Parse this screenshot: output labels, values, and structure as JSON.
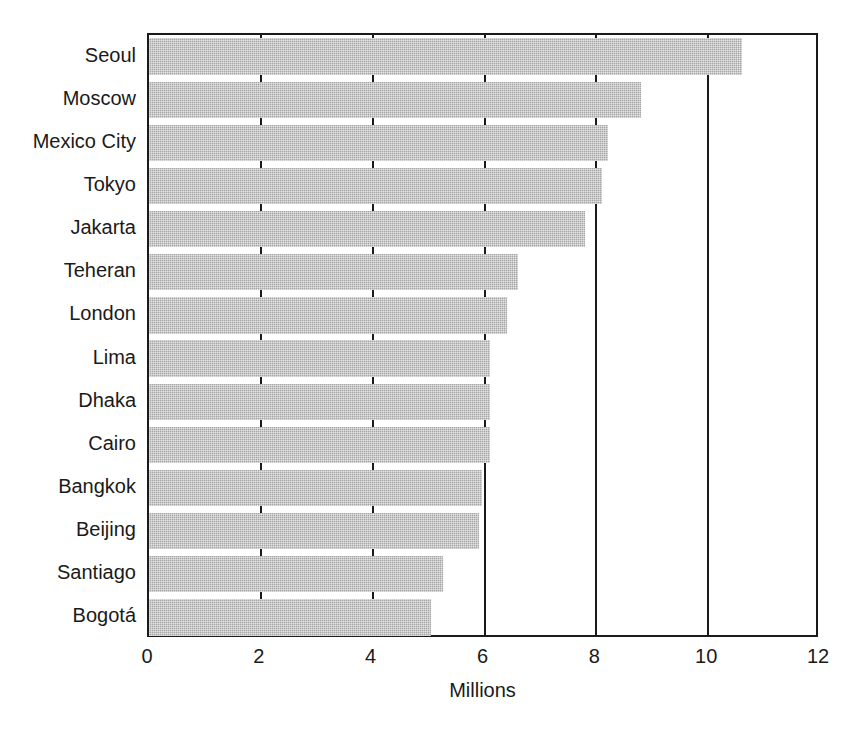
{
  "chart_data": {
    "type": "bar",
    "orientation": "horizontal",
    "title": "",
    "xlabel": "Millions",
    "ylabel": "",
    "xlim": [
      0,
      12
    ],
    "xticks": [
      0,
      2,
      4,
      6,
      8,
      10,
      12
    ],
    "xtick_labels": [
      "0",
      "2",
      "4",
      "6",
      "8",
      "10",
      "12"
    ],
    "grid": "vertical-major",
    "legend": "none",
    "bar_color": "#a6a6a6",
    "categories": [
      "Seoul",
      "Moscow",
      "Mexico City",
      "Tokyo",
      "Jakarta",
      "Teheran",
      "London",
      "Lima",
      "Dhaka",
      "Cairo",
      "Bangkok",
      "Beijing",
      "Santiago",
      "Bogotá"
    ],
    "values": [
      10.6,
      8.8,
      8.2,
      8.1,
      7.8,
      6.6,
      6.4,
      6.1,
      6.1,
      6.1,
      5.95,
      5.9,
      5.25,
      5.05
    ]
  },
  "axis": {
    "x_title": "Millions"
  },
  "caption": {
    "text": ""
  }
}
